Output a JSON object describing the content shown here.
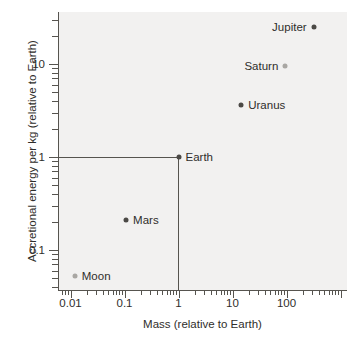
{
  "chart_data": {
    "type": "scatter",
    "title": "",
    "xlabel": "Mass (relative to Earth)",
    "ylabel": "Accretional energy per kg (relative to Earth)",
    "xscale": "log",
    "yscale": "log",
    "xlim": [
      0.006,
      600
    ],
    "ylim": [
      0.04,
      40
    ],
    "grid": false,
    "legend": "none",
    "xticks": [
      "0.01",
      "0.1",
      "1",
      "10",
      "100"
    ],
    "xtick_values": [
      0.01,
      0.1,
      1,
      10,
      100
    ],
    "yticks": [
      "0.1",
      "1",
      "10"
    ],
    "ytick_values": [
      0.1,
      1,
      10
    ],
    "points": [
      {
        "label": "Jupiter",
        "x": 318,
        "y": 25,
        "label_side": "left",
        "marker": "dark"
      },
      {
        "label": "Saturn",
        "x": 95,
        "y": 9.5,
        "label_side": "left",
        "marker": "light"
      },
      {
        "label": "Uranus",
        "x": 14.5,
        "y": 3.6,
        "label_side": "right",
        "marker": "dark"
      },
      {
        "label": "Earth",
        "x": 1,
        "y": 1,
        "label_side": "right",
        "marker": "dark"
      },
      {
        "label": "Mars",
        "x": 0.107,
        "y": 0.21,
        "label_side": "right",
        "marker": "dark"
      },
      {
        "label": "Moon",
        "x": 0.012,
        "y": 0.052,
        "label_side": "right",
        "marker": "light"
      }
    ],
    "reference_lines": {
      "description": "Lines drawn from the Earth point to each axis at value 1",
      "horizontal_y": 1,
      "vertical_x": 1
    },
    "colors": {
      "plot_background": "#f2f1f0",
      "axis": "#56544f",
      "marker_dark": "#4b4945",
      "marker_light": "#a9a7a3",
      "text": "#2f2e2b"
    }
  },
  "watermark": {
    "line1": "Appendix",
    "line2": "The Solar System"
  }
}
